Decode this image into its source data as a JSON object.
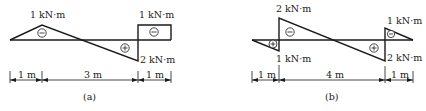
{
  "diagrams": [
    {
      "id": "a",
      "caption": "(a)",
      "labels": {
        "left_peak": "1 kN·m",
        "right_top": "1 kN·m",
        "right_bottom": "2 kN·m"
      },
      "regions": [
        {
          "sign": "−",
          "symbol": "minus-circle"
        },
        {
          "sign": "+",
          "symbol": "plus-circle"
        },
        {
          "sign": "−",
          "symbol": "minus-circle"
        }
      ],
      "dimensions": [
        "1 m",
        "3 m",
        "1 m"
      ]
    },
    {
      "id": "b",
      "caption": "(b)",
      "labels": {
        "left_top": "2 kN·m",
        "left_bottom": "1 kN·m",
        "right_top": "1 kN·m",
        "right_bottom": "2 kN·m"
      },
      "regions": [
        {
          "sign": "+",
          "symbol": "plus-circle"
        },
        {
          "sign": "−",
          "symbol": "minus-circle"
        },
        {
          "sign": "+",
          "symbol": "plus-circle"
        },
        {
          "sign": "−",
          "symbol": "minus-circle"
        }
      ],
      "dimensions": [
        "1 m",
        "4 m",
        "1 m"
      ]
    }
  ]
}
